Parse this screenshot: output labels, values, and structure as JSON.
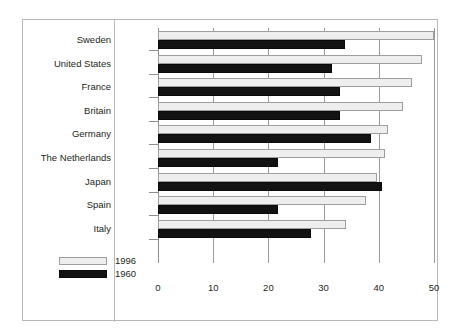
{
  "figure": {
    "top_caption": ""
  },
  "legend": {
    "position": "bottom-left",
    "items": [
      {
        "label": "1996",
        "swatch": "light-bar-swatch",
        "color": "#eeeeee"
      },
      {
        "label": "1960",
        "swatch": "dark-bar-swatch",
        "color": "#121212"
      }
    ]
  },
  "axis": {
    "ticks": [
      "0",
      "10",
      "20",
      "30",
      "40",
      "50"
    ]
  },
  "chart_data": {
    "type": "bar",
    "orientation": "horizontal",
    "title": "",
    "subtitle": "",
    "xlabel": "",
    "ylabel": "",
    "xlim": [
      0,
      50
    ],
    "xticks": [
      0,
      10,
      20,
      30,
      40,
      50
    ],
    "grid": true,
    "legend_position": "bottom-left",
    "categories": [
      "Sweden",
      "United States",
      "France",
      "Britain",
      "Germany",
      "The Netherlands",
      "Japan",
      "Spain",
      "Italy"
    ],
    "series": [
      {
        "name": "1996",
        "color": "#eeeeee",
        "values": [
          50.0,
          47.9,
          46.1,
          44.4,
          41.7,
          41.2,
          39.7,
          37.6,
          34.0
        ]
      },
      {
        "name": "1960",
        "color": "#121212",
        "values": [
          33.8,
          31.6,
          32.9,
          33.0,
          38.6,
          21.7,
          40.5,
          21.7,
          27.7
        ]
      }
    ]
  }
}
